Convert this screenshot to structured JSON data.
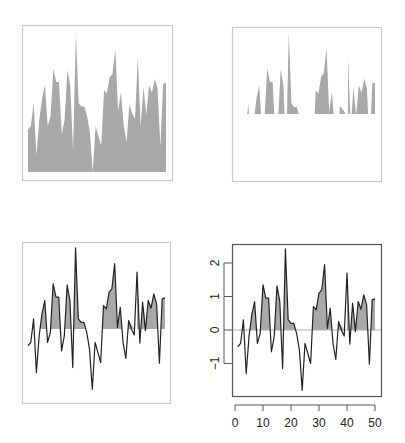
{
  "figure": {
    "width": 405,
    "height": 443,
    "fill_color": "#a8a8a8",
    "line_color": "#222222",
    "frame_color_light": "#c9c9c9",
    "frame_color_dark": "#555555",
    "baseline_color": "#b0b0b0"
  },
  "chart_data": [
    {
      "panel": "top-left",
      "type": "area",
      "title": "",
      "xlabel": "",
      "ylabel": "",
      "description": "Series filled down to its minimum (polygon to bottom), no axes, light frame",
      "fill_mode": "to-min",
      "axes": false,
      "frame": "light"
    },
    {
      "panel": "top-right",
      "type": "area",
      "title": "",
      "xlabel": "",
      "ylabel": "",
      "description": "Only the portions of the series above zero are filled (clipped at 0), no outline, no axes, light frame",
      "fill_mode": "positive-only",
      "axes": false,
      "frame": "light"
    },
    {
      "panel": "bottom-left",
      "type": "line",
      "title": "",
      "xlabel": "",
      "ylabel": "",
      "description": "Line series with positive area shaded between the line and zero, no axes, light frame",
      "fill_mode": "positive-to-zero",
      "axes": false,
      "frame": "light"
    },
    {
      "panel": "bottom-right",
      "type": "line",
      "title": "",
      "xlabel": "",
      "ylabel": "",
      "description": "Line series with positive area shaded to zero, with axes and zero reference line",
      "fill_mode": "positive-to-zero",
      "axes": true,
      "frame": "dark",
      "xlim": [
        0,
        50
      ],
      "ylim": [
        -1.9,
        2.5
      ],
      "x_ticks": [
        0,
        10,
        20,
        30,
        40,
        50
      ],
      "y_ticks": [
        -1,
        0,
        1,
        2
      ],
      "grid": false,
      "reference_line_y": 0
    }
  ],
  "series": {
    "x": [
      1,
      2,
      3,
      4,
      5,
      6,
      7,
      8,
      9,
      10,
      11,
      12,
      13,
      14,
      15,
      16,
      17,
      18,
      19,
      20,
      21,
      22,
      23,
      24,
      25,
      26,
      27,
      28,
      29,
      30,
      31,
      32,
      33,
      34,
      35,
      36,
      37,
      38,
      39,
      40,
      41,
      42,
      43,
      44,
      45,
      46,
      47,
      48,
      49,
      50
    ],
    "y": [
      -0.5,
      -0.4,
      0.3,
      -1.3,
      -0.2,
      0.45,
      0.85,
      -0.4,
      -0.1,
      1.35,
      0.95,
      0.95,
      -0.65,
      -0.2,
      1.32,
      0.85,
      -1.15,
      2.42,
      0.3,
      0.2,
      0.2,
      -0.1,
      -0.6,
      -1.8,
      -0.4,
      -0.7,
      -1.0,
      0.7,
      0.6,
      1.1,
      1.2,
      1.95,
      0.05,
      0.65,
      -0.4,
      -0.88,
      0.25,
      0.0,
      -0.18,
      1.7,
      -0.42,
      0.8,
      -0.05,
      0.85,
      0.62,
      1.05,
      0.75,
      -1.02,
      0.9,
      0.93
    ]
  },
  "axis_labels": {
    "x_ticks": [
      "0",
      "10",
      "20",
      "30",
      "40",
      "50"
    ],
    "y_ticks": [
      "-1",
      "0",
      "1",
      "2"
    ]
  }
}
